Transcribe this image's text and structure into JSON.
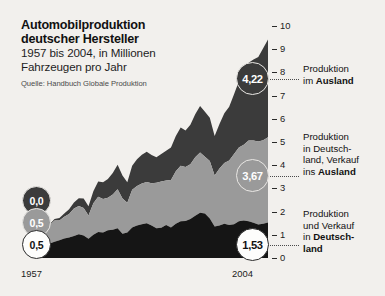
{
  "title": {
    "line1": "Automobilproduktion",
    "line2": "deutscher Hersteller",
    "line3": "1957 bis 2004, in Millionen",
    "line4": "Fahrzeugen pro Jahr",
    "source": "Quelle: Handbuch Globale Produktion"
  },
  "axis": {
    "ticks": [
      "10",
      "9",
      "8",
      "7",
      "6",
      "5",
      "4",
      "3",
      "2",
      "1",
      "0"
    ]
  },
  "years": {
    "start": "1957",
    "end": "2004"
  },
  "legend": [
    {
      "id": "ausland",
      "pre": "Produktion",
      "mid": "im ",
      "bold": "Ausland",
      "post": ""
    },
    {
      "id": "deutschland-export",
      "pre": "Produktion",
      "mid": "in Deutsch-",
      "bold2": "land, Verkauf",
      "tail_pre": "ins ",
      "bold": "Ausland"
    },
    {
      "id": "deutschland-inland",
      "pre": "Produktion",
      "mid": "und Verkauf",
      "tail_pre": "in ",
      "bold": "Deutsch-",
      "bold3": "land"
    }
  ],
  "legend_text": {
    "l1_a": "Produktion",
    "l1_b": "im ",
    "l1_bold": "Ausland",
    "l2_a": "Produktion",
    "l2_b": "in Deutsch-",
    "l2_c": "land, Verkauf",
    "l2_d": "ins ",
    "l2_bold": "Ausland",
    "l3_a": "Produktion",
    "l3_b": "und Verkauf",
    "l3_c": "in ",
    "l3_bold1": "Deutsch-",
    "l3_bold2": "land"
  },
  "bubbles": {
    "start_top": "0,0",
    "start_mid": "0,5",
    "start_bot": "0,5",
    "end_top": "4,22",
    "end_mid": "3,67",
    "end_bot": "1,53"
  },
  "colors": {
    "background": "#f2f0ed",
    "layer_top": "#3b3b3b",
    "layer_mid": "#9a9a9a",
    "layer_bottom": "#151515",
    "text": "#1b1b1b",
    "tick": "#2a2a2a"
  },
  "chart_data": {
    "type": "area",
    "title": "Automobilproduktion deutscher Hersteller",
    "subtitle": "1957 bis 2004, in Millionen Fahrzeugen pro Jahr",
    "source": "Quelle: Handbuch Globale Produktion",
    "xlabel": "",
    "ylabel": "Millionen Fahrzeuge pro Jahr",
    "xlim": [
      1957,
      2004
    ],
    "ylim": [
      0,
      10
    ],
    "yticks": [
      0,
      1,
      2,
      3,
      4,
      5,
      6,
      7,
      8,
      9,
      10
    ],
    "grid": false,
    "stacked": true,
    "legend_position": "right",
    "x": [
      1957,
      1958,
      1959,
      1960,
      1961,
      1962,
      1963,
      1964,
      1965,
      1966,
      1967,
      1968,
      1969,
      1970,
      1971,
      1972,
      1973,
      1974,
      1975,
      1976,
      1977,
      1978,
      1979,
      1980,
      1981,
      1982,
      1983,
      1984,
      1985,
      1986,
      1987,
      1988,
      1989,
      1990,
      1991,
      1992,
      1993,
      1994,
      1995,
      1996,
      1997,
      1998,
      1999,
      2000,
      2001,
      2002,
      2003,
      2004
    ],
    "series": [
      {
        "name": "Produktion und Verkauf in Deutschland",
        "color": "#151515",
        "endpoint_label": "1,53",
        "start_label": "0,5",
        "values": [
          0.5,
          0.56,
          0.63,
          0.7,
          0.76,
          0.84,
          0.88,
          0.95,
          1.02,
          0.97,
          0.83,
          1.0,
          1.12,
          1.1,
          1.2,
          1.22,
          1.28,
          1.04,
          1.1,
          1.32,
          1.4,
          1.45,
          1.5,
          1.4,
          1.28,
          1.3,
          1.42,
          1.32,
          1.48,
          1.58,
          1.6,
          1.68,
          1.82,
          1.95,
          1.92,
          1.7,
          1.36,
          1.4,
          1.48,
          1.42,
          1.46,
          1.58,
          1.62,
          1.58,
          1.52,
          1.44,
          1.48,
          1.53
        ]
      },
      {
        "name": "Produktion in Deutschland, Verkauf ins Ausland",
        "color": "#9a9a9a",
        "endpoint_label": "3,67",
        "start_label": "0,5",
        "values": [
          0.5,
          0.62,
          0.78,
          0.92,
          0.86,
          0.94,
          1.02,
          1.18,
          1.22,
          1.18,
          1.0,
          1.36,
          1.52,
          1.44,
          1.4,
          1.52,
          1.68,
          1.52,
          1.28,
          1.62,
          1.7,
          1.76,
          1.78,
          1.82,
          1.96,
          2.0,
          1.92,
          2.04,
          2.26,
          2.4,
          2.32,
          2.36,
          2.52,
          2.6,
          2.44,
          2.48,
          2.2,
          2.46,
          2.62,
          2.78,
          3.02,
          3.18,
          3.26,
          3.48,
          3.54,
          3.58,
          3.6,
          3.67
        ]
      },
      {
        "name": "Produktion im Ausland",
        "color": "#3b3b3b",
        "endpoint_label": "4,22",
        "start_label": "0,0",
        "values": [
          0.0,
          0.02,
          0.04,
          0.06,
          0.1,
          0.14,
          0.2,
          0.26,
          0.34,
          0.42,
          0.4,
          0.52,
          0.66,
          0.72,
          0.8,
          0.92,
          1.06,
          1.0,
          0.88,
          1.04,
          1.16,
          1.24,
          1.3,
          1.22,
          1.1,
          1.18,
          1.28,
          1.4,
          1.52,
          1.64,
          1.58,
          1.7,
          1.86,
          2.0,
          1.94,
          1.86,
          1.7,
          1.92,
          2.14,
          2.32,
          2.58,
          2.86,
          3.1,
          3.36,
          3.5,
          3.64,
          3.96,
          4.22
        ]
      }
    ],
    "totals_endpoint": 9.42,
    "annotations": [
      {
        "text": "0,0",
        "position": "start",
        "series": "Produktion im Ausland"
      },
      {
        "text": "0,5",
        "position": "start",
        "series": "Produktion in Deutschland, Verkauf ins Ausland"
      },
      {
        "text": "0,5",
        "position": "start",
        "series": "Produktion und Verkauf in Deutschland"
      },
      {
        "text": "4,22",
        "position": "end",
        "series": "Produktion im Ausland"
      },
      {
        "text": "3,67",
        "position": "end",
        "series": "Produktion in Deutschland, Verkauf ins Ausland"
      },
      {
        "text": "1,53",
        "position": "end",
        "series": "Produktion und Verkauf in Deutschland"
      }
    ]
  }
}
